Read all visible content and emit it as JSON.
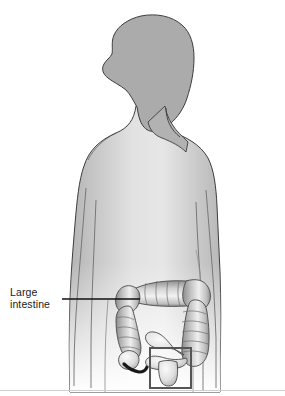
{
  "figure": {
    "name": "large-intestine-anatomy-illustration",
    "background_color": "#ffffff",
    "width": 285,
    "height": 396
  },
  "labels": {
    "large_intestine": {
      "text": "Large\nintestine",
      "line1": "Large",
      "line2": "intestine",
      "color": "#1a1a1a"
    }
  },
  "leader_line": {
    "name": "leader-line-large-intestine",
    "color": "#111111",
    "x1": 62,
    "y1": 299,
    "x2": 140,
    "y2": 299
  },
  "highlight_box": {
    "name": "rectum-highlight-box",
    "stroke": "#555555",
    "x": 150,
    "y": 348,
    "width": 41,
    "height": 40
  },
  "colors": {
    "body_fill_edge": "#b6b6b6",
    "body_fill_center": "#f2f2f2",
    "head_fill": "#ababab",
    "body_outline": "#3a3a3a",
    "colon_light": "#f0f0f0",
    "colon_mid": "#bdbdbd",
    "colon_dark": "#6e6e6e",
    "colon_outline": "#4a4a4a",
    "appendix_dark": "#181818",
    "baseline_rule": "#cfcfcf",
    "text": "#1a1a1a"
  },
  "anatomy_parts": [
    {
      "name": "head-profile",
      "description": "Head shown in left-facing profile with hair"
    },
    {
      "name": "neck",
      "description": "Neck connecting head to shoulders"
    },
    {
      "name": "torso",
      "description": "Shoulders, chest and abdomen, gradient shaded"
    },
    {
      "name": "left-arm-outline",
      "description": "Thin outlined arm on viewer left"
    },
    {
      "name": "right-arm-outline",
      "description": "Thin outlined arm on viewer right"
    },
    {
      "name": "hip-outline",
      "description": "Pelvis and upper leg outlines fading to white"
    },
    {
      "name": "ascending-colon",
      "description": "Haustrated colon rising on viewer right"
    },
    {
      "name": "transverse-colon",
      "description": "Horizontal haustrated colon across abdomen"
    },
    {
      "name": "descending-colon",
      "description": "Haustrated colon descending on viewer left"
    },
    {
      "name": "cecum-appendix",
      "description": "Pouch with dark curved appendix at lower left"
    },
    {
      "name": "sigmoid-colon",
      "description": "S-shaped loop at lower center"
    },
    {
      "name": "rectum",
      "description": "Terminal segment inside highlight box"
    }
  ],
  "baseline_rule": {
    "name": "bottom-rule",
    "y": 390,
    "color": "#cfcfcf"
  }
}
